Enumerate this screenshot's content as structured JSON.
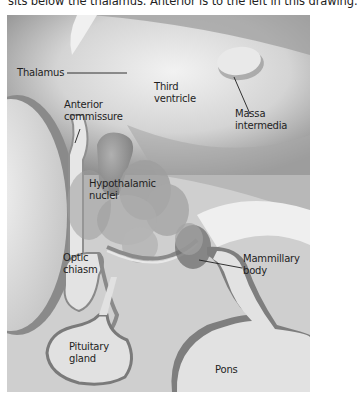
{
  "caption": "sits below the thalamus. Anterior is to the left in this drawing.",
  "labels": {
    "thalamus": "Thalamus",
    "third_ventricle_1": "Third",
    "third_ventricle_2": "ventricle",
    "massa_1": "Massa",
    "massa_2": "intermedia",
    "anterior_1": "Anterior",
    "anterior_2": "commissure",
    "hypo_1": "Hypothalamic",
    "hypo_2": "nuclei",
    "optic_1": "Optic",
    "optic_2": "chiasm",
    "mammillary_1": "Mammillary",
    "mammillary_2": "body",
    "pituitary_1": "Pituitary",
    "pituitary_2": "gland",
    "pons": "Pons"
  },
  "colors": {
    "background": "#ffffff",
    "tissue_light": "#e6e6e6",
    "tissue_mid": "#bdbdbd",
    "tissue_dark": "#7a7a7a",
    "text": "#1e1e1e"
  }
}
